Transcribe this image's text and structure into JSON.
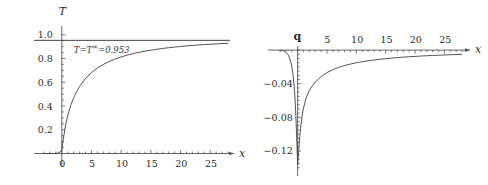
{
  "figure": {
    "background": "#ffffff",
    "curve_color": "#404040",
    "axis_color": "#555555",
    "text_color": "#2b2b2b"
  },
  "chart_data": [
    {
      "id": "temperature-profile",
      "type": "line",
      "title": "",
      "xlabel": "x",
      "ylabel": "T",
      "xlim": [
        -3,
        28
      ],
      "ylim": [
        -0.08,
        1.04
      ],
      "xticks": [
        0,
        5,
        10,
        15,
        20,
        25
      ],
      "yticks": [
        0.2,
        0.4,
        0.6,
        0.8,
        1.0
      ],
      "xticklabels": [
        "0",
        "5",
        "10",
        "15",
        "20",
        "25"
      ],
      "yticklabels": [
        "0.2",
        "0.4",
        "0.6",
        "0.8",
        "1.0"
      ],
      "grid": false,
      "legend": "none",
      "annotations": [
        {
          "id": "asymptote-label",
          "text_prefix": "T",
          "text_eq1": "=",
          "text_sym": "T",
          "text_sup": "∞",
          "text_eq2": "=",
          "text_value": "0.953",
          "full_text": "T=T∞=0.953",
          "x": 1.0,
          "y": 0.88
        }
      ],
      "series": [
        {
          "name": "T(x)",
          "style": "solid",
          "x": [
            -3,
            -2.5,
            -2,
            -1.5,
            -1,
            -0.6,
            -0.3,
            -0.1,
            0,
            0.25,
            0.5,
            0.75,
            1,
            1.5,
            2,
            2.5,
            3,
            4,
            5,
            6,
            7,
            8,
            9,
            10,
            11,
            12,
            13,
            14,
            15,
            16,
            17,
            18,
            19,
            20,
            21,
            22,
            23,
            24,
            25,
            26,
            27,
            28
          ],
          "y": [
            0.0,
            0.0,
            0.0,
            0.0,
            0.001,
            0.004,
            0.012,
            0.022,
            0.03,
            0.12,
            0.2,
            0.265,
            0.32,
            0.405,
            0.47,
            0.522,
            0.565,
            0.632,
            0.682,
            0.72,
            0.75,
            0.775,
            0.796,
            0.813,
            0.828,
            0.841,
            0.852,
            0.862,
            0.87,
            0.878,
            0.885,
            0.891,
            0.896,
            0.901,
            0.906,
            0.91,
            0.914,
            0.917,
            0.92,
            0.923,
            0.926,
            0.928
          ]
        },
        {
          "name": "T_infinity asymptote",
          "style": "solid-horizontal",
          "value": 0.953
        }
      ]
    },
    {
      "id": "heat-flux-profile",
      "type": "line",
      "title": "",
      "xlabel": "x",
      "ylabel": "q",
      "xlim": [
        -3,
        28
      ],
      "ylim": [
        -0.145,
        0.012
      ],
      "xticks": [
        5,
        10,
        15,
        20,
        25
      ],
      "yticks": [
        -0.04,
        -0.08,
        -0.12
      ],
      "xticklabels": [
        "5",
        "10",
        "15",
        "20",
        "25"
      ],
      "yticklabels": [
        "-0.04",
        "-0.08",
        "-0.12"
      ],
      "grid": false,
      "legend": "none",
      "annotations": [],
      "series": [
        {
          "name": "q(x) left branch",
          "style": "solid",
          "x": [
            -3,
            -2.6,
            -2.2,
            -1.8,
            -1.5,
            -1.2,
            -1.0,
            -0.8,
            -0.6,
            -0.45,
            -0.3,
            -0.2,
            -0.12,
            -0.06,
            -0.02,
            0
          ],
          "y": [
            0.0,
            -0.0005,
            -0.0015,
            -0.004,
            -0.007,
            -0.013,
            -0.019,
            -0.028,
            -0.042,
            -0.057,
            -0.078,
            -0.096,
            -0.112,
            -0.124,
            -0.132,
            -0.136
          ]
        },
        {
          "name": "q(x) right branch",
          "style": "solid",
          "x": [
            0,
            0.1,
            0.2,
            0.35,
            0.5,
            0.75,
            1,
            1.5,
            2,
            2.5,
            3,
            4,
            5,
            6,
            7,
            8,
            9,
            10,
            11,
            12,
            13,
            14,
            15,
            16,
            17,
            18,
            19,
            20,
            21,
            22,
            23,
            24,
            25,
            26,
            27,
            28
          ],
          "y": [
            -0.136,
            -0.128,
            -0.118,
            -0.104,
            -0.093,
            -0.079,
            -0.069,
            -0.056,
            -0.048,
            -0.0425,
            -0.038,
            -0.0315,
            -0.0268,
            -0.0233,
            -0.0206,
            -0.0184,
            -0.0166,
            -0.0151,
            -0.0138,
            -0.0127,
            -0.0118,
            -0.0109,
            -0.0102,
            -0.0095,
            -0.0089,
            -0.0084,
            -0.0079,
            -0.0075,
            -0.0071,
            -0.0067,
            -0.0064,
            -0.0061,
            -0.0058,
            -0.0055,
            -0.0053,
            -0.005
          ]
        }
      ]
    }
  ]
}
